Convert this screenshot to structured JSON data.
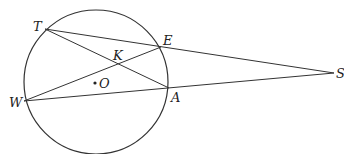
{
  "diagram": {
    "type": "circle-geometry",
    "circle": {
      "center_label": "O",
      "cx": 96,
      "cy": 82,
      "r": 72
    },
    "points": {
      "T": {
        "label": "T",
        "x": 45,
        "y": 29,
        "lx": 33,
        "ly": 31
      },
      "E": {
        "label": "E",
        "x": 161,
        "y": 47,
        "lx": 163,
        "ly": 45
      },
      "A": {
        "label": "A",
        "x": 169,
        "y": 88,
        "lx": 171,
        "ly": 102
      },
      "W": {
        "label": "W",
        "x": 24,
        "y": 101,
        "lx": 9,
        "ly": 107
      },
      "S": {
        "label": "S",
        "x": 334,
        "y": 73,
        "lx": 336,
        "ly": 78
      },
      "K": {
        "label": "K",
        "x": 118,
        "y": 64,
        "lx": 113,
        "ly": 60
      },
      "O": {
        "label": "O",
        "x": 95,
        "y": 83,
        "lx": 99,
        "ly": 88
      }
    },
    "segments": [
      [
        "T",
        "S"
      ],
      [
        "T",
        "A"
      ],
      [
        "W",
        "E"
      ],
      [
        "W",
        "S"
      ]
    ],
    "colors": {
      "stroke": "#333333",
      "text": "#222222"
    }
  }
}
